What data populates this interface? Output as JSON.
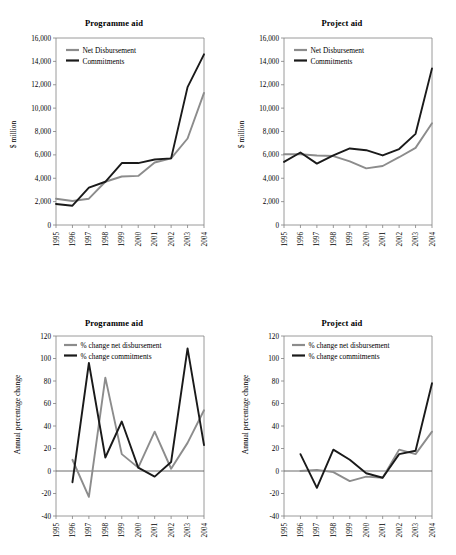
{
  "figure": {
    "background": "#ffffff",
    "series_colors": {
      "net_disbursement": "#8c8c8c",
      "commitments": "#1a1a1a"
    }
  },
  "panels": {
    "top_left": {
      "title": "Programme aid",
      "ylabel": "$ million",
      "legend": {
        "net_disbursement": "Net Disbursement",
        "commitments": "Commitments"
      }
    },
    "top_right": {
      "title": "Project aid",
      "ylabel": "$ million",
      "legend": {
        "net_disbursement": "Net Disbursement",
        "commitments": "Commitments"
      }
    },
    "bottom_left": {
      "title": "Programme aid",
      "ylabel": "Annual  percentage change",
      "legend": {
        "net_disbursement": "% change net disbursement",
        "commitments": "% change commitments"
      }
    },
    "bottom_right": {
      "title": "Project aid",
      "ylabel": "Annual  percentage change",
      "legend": {
        "net_disbursement": "% change net disbursement",
        "commitments": "% change commitments"
      }
    }
  },
  "axis_labels": {
    "years": [
      "1995",
      "1996",
      "1997",
      "1998",
      "1999",
      "2000",
      "2001",
      "2002",
      "2003",
      "2004"
    ],
    "level_yticks": [
      "0",
      "2,000",
      "4,000",
      "6,000",
      "8,000",
      "10,000",
      "12,000",
      "14,000",
      "16,000"
    ],
    "change_yticks": [
      "-40",
      "-20",
      "0",
      "20",
      "40",
      "60",
      "80",
      "100",
      "120"
    ]
  },
  "chart_data": [
    {
      "id": "top_left",
      "type": "line",
      "title": "Programme aid",
      "xlabel": "",
      "ylabel": "$ million",
      "x": [
        1995,
        1996,
        1997,
        1998,
        1999,
        2000,
        2001,
        2002,
        2003,
        2004
      ],
      "xticklabels": [
        "1995",
        "1996",
        "1997",
        "1998",
        "1999",
        "2000",
        "2001",
        "2002",
        "2003",
        "2004"
      ],
      "ylim": [
        0,
        16000
      ],
      "ytickvalues": [
        0,
        2000,
        4000,
        6000,
        8000,
        10000,
        12000,
        14000,
        16000
      ],
      "grid": false,
      "legend_position": "upper left",
      "series": [
        {
          "name": "Net Disbursement",
          "color": "#8c8c8c",
          "values": [
            2250,
            2050,
            2250,
            3700,
            4150,
            4200,
            5350,
            5700,
            7400,
            11300
          ]
        },
        {
          "name": "Commitments",
          "color": "#1a1a1a",
          "values": [
            1800,
            1650,
            3200,
            3700,
            5300,
            5300,
            5600,
            5700,
            11800,
            14600
          ]
        }
      ]
    },
    {
      "id": "top_right",
      "type": "line",
      "title": "Project aid",
      "xlabel": "",
      "ylabel": "$ million",
      "x": [
        1995,
        1996,
        1997,
        1998,
        1999,
        2000,
        2001,
        2002,
        2003,
        2004
      ],
      "xticklabels": [
        "1995",
        "1996",
        "1997",
        "1998",
        "1999",
        "2000",
        "2001",
        "2002",
        "2003",
        "2004"
      ],
      "ylim": [
        0,
        16000
      ],
      "ytickvalues": [
        0,
        2000,
        4000,
        6000,
        8000,
        10000,
        12000,
        14000,
        16000
      ],
      "grid": false,
      "legend_position": "upper left",
      "series": [
        {
          "name": "Net Disbursement",
          "color": "#8c8c8c",
          "values": [
            6050,
            6050,
            5950,
            5900,
            5450,
            4850,
            5050,
            5800,
            6600,
            8700
          ]
        },
        {
          "name": "Commitments",
          "color": "#1a1a1a",
          "values": [
            5400,
            6200,
            5250,
            5950,
            6550,
            6400,
            5950,
            6500,
            7800,
            13400
          ]
        }
      ]
    },
    {
      "id": "bottom_left",
      "type": "line",
      "title": "Programme aid",
      "xlabel": "",
      "ylabel": "Annual  percentage change",
      "x": [
        1996,
        1997,
        1998,
        1999,
        2000,
        2001,
        2002,
        2003,
        2004
      ],
      "xticklabels": [
        "1995",
        "1996",
        "1997",
        "1998",
        "1999",
        "2000",
        "2001",
        "2002",
        "2003",
        "2004"
      ],
      "ylim": [
        -40,
        120
      ],
      "ytickvalues": [
        -40,
        -20,
        0,
        20,
        40,
        60,
        80,
        100,
        120
      ],
      "grid": false,
      "legend_position": "upper left",
      "series": [
        {
          "name": "% change net disbursement",
          "color": "#8c8c8c",
          "values": [
            10,
            -23,
            83,
            15,
            3,
            35,
            2,
            25,
            54
          ]
        },
        {
          "name": "% change commitments",
          "color": "#1a1a1a",
          "values": [
            -10,
            96,
            12,
            44,
            3,
            -5,
            8,
            109,
            23
          ]
        }
      ]
    },
    {
      "id": "bottom_right",
      "type": "line",
      "title": "Project aid",
      "xlabel": "",
      "ylabel": "Annual  percentage change",
      "x": [
        1996,
        1997,
        1998,
        1999,
        2000,
        2001,
        2002,
        2003,
        2004
      ],
      "xticklabels": [
        "1995",
        "1996",
        "1997",
        "1998",
        "1999",
        "2000",
        "2001",
        "2002",
        "2003",
        "2004"
      ],
      "ylim": [
        -40,
        120
      ],
      "ytickvalues": [
        -40,
        -20,
        0,
        20,
        40,
        60,
        80,
        100,
        120
      ],
      "grid": false,
      "legend_position": "upper left",
      "series": [
        {
          "name": "% change net disbursement",
          "color": "#8c8c8c",
          "values": [
            0,
            1,
            -1,
            -9,
            -5,
            -6,
            19,
            15,
            35
          ]
        },
        {
          "name": "% change commitments",
          "color": "#1a1a1a",
          "values": [
            15,
            -15,
            19,
            10,
            -2,
            -6,
            15,
            18,
            78
          ]
        }
      ]
    }
  ]
}
